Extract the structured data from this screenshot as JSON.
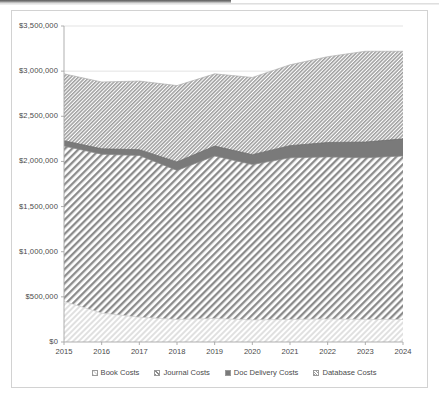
{
  "chart_data": {
    "type": "area",
    "stacked": true,
    "title": "",
    "subtitle": "",
    "xlabel": "",
    "ylabel": "",
    "grid": true,
    "legend_position": "bottom",
    "x": [
      2015,
      2016,
      2017,
      2018,
      2019,
      2020,
      2021,
      2022,
      2023,
      2024
    ],
    "categories": [
      "2015",
      "2016",
      "2017",
      "2018",
      "2019",
      "2020",
      "2021",
      "2022",
      "2023",
      "2024"
    ],
    "xlim": [
      2015,
      2024
    ],
    "ylim": [
      0,
      3500000
    ],
    "ytick_values": [
      0,
      500000,
      1000000,
      1500000,
      2000000,
      2500000,
      3000000,
      3500000
    ],
    "ytick_labels": [
      "$0",
      "$500,000",
      "$1,000,000",
      "$1,500,000",
      "$2,000,000",
      "$2,500,000",
      "$3,000,000",
      "$3,500,000"
    ],
    "xtick_labels": [
      "2015",
      "2016",
      "2017",
      "2018",
      "2019",
      "2020",
      "2021",
      "2022",
      "2023",
      "2024"
    ],
    "series": [
      {
        "name": "Book Costs",
        "legend_marker": "light-diagonal-hatch",
        "color": "#e8e8e8",
        "values": [
          450000,
          320000,
          275000,
          250000,
          260000,
          245000,
          250000,
          255000,
          250000,
          250000
        ]
      },
      {
        "name": "Journal Costs",
        "legend_marker": "diagonal-hatch",
        "color": "#a8a8a8",
        "values": [
          1720000,
          1760000,
          1790000,
          1650000,
          1800000,
          1720000,
          1790000,
          1795000,
          1790000,
          1810000
        ]
      },
      {
        "name": "Doc Delivery Costs",
        "legend_marker": "solid-dark-square",
        "color": "#6e6e6e",
        "values": [
          60000,
          60000,
          65000,
          95000,
          110000,
          110000,
          135000,
          160000,
          175000,
          190000
        ]
      },
      {
        "name": "Database Costs",
        "legend_marker": "dense-hatch",
        "color": "#bdbdbd",
        "values": [
          740000,
          740000,
          760000,
          845000,
          800000,
          855000,
          895000,
          950000,
          1005000,
          970000
        ]
      }
    ],
    "stack_tops": {
      "book": [
        450000,
        320000,
        275000,
        250000,
        260000,
        245000,
        250000,
        255000,
        250000,
        250000
      ],
      "journal": [
        2170000,
        2080000,
        2065000,
        1900000,
        2060000,
        1965000,
        2040000,
        2050000,
        2040000,
        2060000
      ],
      "doc_delivery": [
        2230000,
        2140000,
        2130000,
        1995000,
        2170000,
        2075000,
        2175000,
        2210000,
        2215000,
        2250000
      ],
      "total": [
        2970000,
        2880000,
        2890000,
        2840000,
        2970000,
        2930000,
        3070000,
        3160000,
        3220000,
        3220000
      ]
    }
  },
  "legend": {
    "items": [
      {
        "label": "Book Costs"
      },
      {
        "label": "Journal Costs"
      },
      {
        "label": "Doc Delivery Costs"
      },
      {
        "label": "Database Costs"
      }
    ]
  }
}
